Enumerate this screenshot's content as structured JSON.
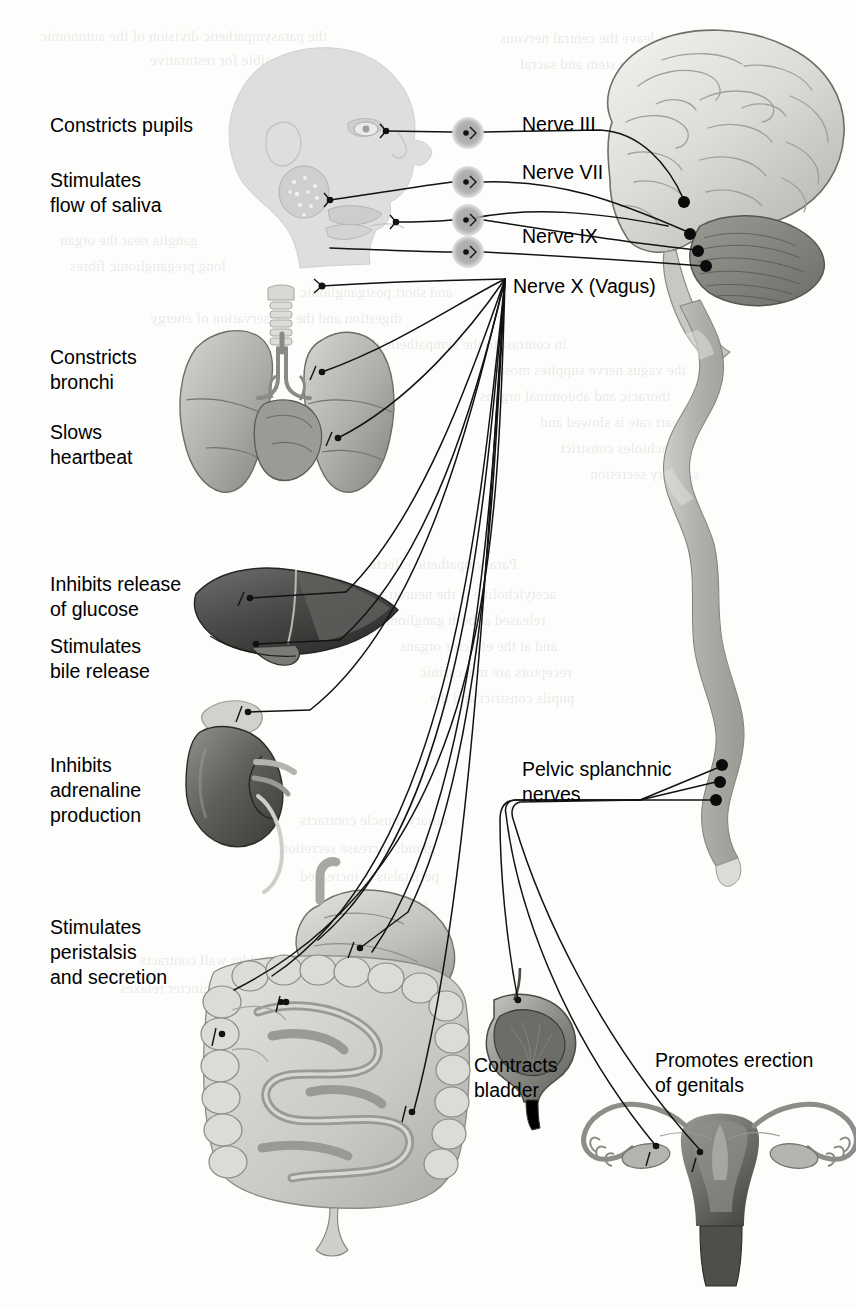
{
  "diagram": {
    "type": "anatomical-diagram",
    "background_color": "#fdfdfc",
    "text_color": "#000000"
  },
  "left_labels": [
    {
      "id": "constricts-pupils",
      "text": "Constricts pupils",
      "x": 50,
      "y": 113
    },
    {
      "id": "stimulates-saliva",
      "text": "Stimulates\nflow of saliva",
      "x": 50,
      "y": 168
    },
    {
      "id": "constricts-bronchi",
      "text": "Constricts\nbronchi",
      "x": 50,
      "y": 345
    },
    {
      "id": "slows-heartbeat",
      "text": "Slows\nheartbeat",
      "x": 50,
      "y": 420
    },
    {
      "id": "inhibits-glucose",
      "text": "Inhibits release\nof glucose",
      "x": 50,
      "y": 572
    },
    {
      "id": "stimulates-bile",
      "text": "Stimulates\nbile release",
      "x": 50,
      "y": 634
    },
    {
      "id": "inhibits-adrenaline",
      "text": "Inhibits\nadrenaline\nproduction",
      "x": 50,
      "y": 753
    },
    {
      "id": "stimulates-peristalsis",
      "text": "Stimulates\nperistalsis\nand secretion",
      "x": 50,
      "y": 915
    }
  ],
  "nerve_labels": [
    {
      "id": "nerve-iii",
      "text": "Nerve III",
      "x": 522,
      "y": 112
    },
    {
      "id": "nerve-vii",
      "text": "Nerve VII",
      "x": 522,
      "y": 160
    },
    {
      "id": "nerve-ix",
      "text": "Nerve IX",
      "x": 522,
      "y": 224
    },
    {
      "id": "nerve-x",
      "text": "Nerve X (Vagus)",
      "x": 513,
      "y": 274
    }
  ],
  "other_labels": [
    {
      "id": "pelvic-splanchnic",
      "text": "Pelvic splanchnic\nnerves",
      "x": 522,
      "y": 757
    },
    {
      "id": "contracts-bladder",
      "text": "Contracts\nbladder",
      "x": 474,
      "y": 1053
    },
    {
      "id": "promotes-erection",
      "text": "Promotes erection\nof genitals",
      "x": 655,
      "y": 1048
    }
  ],
  "organs": [
    {
      "id": "head",
      "name": "head-profile"
    },
    {
      "id": "brain",
      "name": "brain"
    },
    {
      "id": "spinal-cord",
      "name": "spinal-cord"
    },
    {
      "id": "trachea",
      "name": "trachea"
    },
    {
      "id": "lungs",
      "name": "lungs-and-heart"
    },
    {
      "id": "liver",
      "name": "liver"
    },
    {
      "id": "kidney",
      "name": "kidney-and-adrenal-gland"
    },
    {
      "id": "stomach",
      "name": "stomach"
    },
    {
      "id": "intestines",
      "name": "intestines"
    },
    {
      "id": "bladder",
      "name": "bladder"
    },
    {
      "id": "uterus",
      "name": "uterus-and-ovaries"
    }
  ],
  "ganglia": [
    {
      "id": "ganglion-1",
      "cx": 468,
      "cy": 133
    },
    {
      "id": "ganglion-2",
      "cx": 468,
      "cy": 182
    },
    {
      "id": "ganglion-3",
      "cx": 468,
      "cy": 220
    },
    {
      "id": "ganglion-4",
      "cx": 468,
      "cy": 252
    }
  ],
  "nerve_origins": [
    {
      "id": "origin-iii",
      "cx": 684,
      "cy": 202
    },
    {
      "id": "origin-vii",
      "cx": 690,
      "cy": 234
    },
    {
      "id": "origin-ix",
      "cx": 698,
      "cy": 251
    },
    {
      "id": "origin-x",
      "cx": 706,
      "cy": 266
    },
    {
      "id": "origin-pelvic-1",
      "cx": 722,
      "cy": 765
    },
    {
      "id": "origin-pelvic-2",
      "cx": 720,
      "cy": 782
    },
    {
      "id": "origin-pelvic-3",
      "cx": 716,
      "cy": 800
    }
  ],
  "bleed_text": [
    {
      "text": "the parasympathetic division of the autonomic",
      "x": 40,
      "y": 28
    },
    {
      "text": "system is responsible for restorative",
      "x": 150,
      "y": 52
    },
    {
      "text": "fibres leave the central nervous",
      "x": 500,
      "y": 30
    },
    {
      "text": "the brain stem and sacral",
      "x": 520,
      "y": 56
    },
    {
      "text": "ganglia near the organ",
      "x": 60,
      "y": 232
    },
    {
      "text": "long preganglionic fibres",
      "x": 70,
      "y": 258
    },
    {
      "text": "and short postganglionic",
      "x": 300,
      "y": 284
    },
    {
      "text": "digestion and the conservation of energy",
      "x": 150,
      "y": 310
    },
    {
      "text": "in contrast to the sympathetic division",
      "x": 330,
      "y": 336
    },
    {
      "text": "the vagus nerve supplies most",
      "x": 500,
      "y": 362
    },
    {
      "text": "thoracic and abdominal organs",
      "x": 480,
      "y": 388
    },
    {
      "text": "heart rate is slowed and",
      "x": 540,
      "y": 414
    },
    {
      "text": "bronchioles constrict",
      "x": 560,
      "y": 440
    },
    {
      "text": "salivary secretion",
      "x": 590,
      "y": 466
    },
    {
      "text": "Parasympathetic effects",
      "x": 370,
      "y": 556
    },
    {
      "text": "acetylcholine is the neurotransmitter",
      "x": 330,
      "y": 586
    },
    {
      "text": "released at both ganglionic synapses",
      "x": 320,
      "y": 612
    },
    {
      "text": "and at the effector organs",
      "x": 400,
      "y": 638
    },
    {
      "text": "receptors are muscarinic",
      "x": 420,
      "y": 664
    },
    {
      "text": "pupils constrict and the",
      "x": 430,
      "y": 690
    },
    {
      "text": "ciliary muscle contracts",
      "x": 300,
      "y": 812
    },
    {
      "text": "glands increase secretion",
      "x": 280,
      "y": 840
    },
    {
      "text": "peristalsis is increased",
      "x": 300,
      "y": 868
    },
    {
      "text": "sphincters relax",
      "x": 330,
      "y": 896
    },
    {
      "text": "bladder wall contracts",
      "x": 140,
      "y": 952
    },
    {
      "text": "and the sphincter relaxes",
      "x": 120,
      "y": 980
    }
  ],
  "colors": {
    "line": "#1a1a1a",
    "ganglion_fill": "#a8a8a8",
    "brain_light": "#e8e8e6",
    "brain_mid": "#c9c9c5",
    "brain_dark": "#8f8f8a",
    "head_fill": "#dededd",
    "liver_dark": "#4a4a4a",
    "kidney_dark": "#5a5a5a",
    "lung_mid": "#b4b4b0",
    "intestine_light": "#d5d5d2",
    "uterus_dark": "#6a6a68"
  }
}
